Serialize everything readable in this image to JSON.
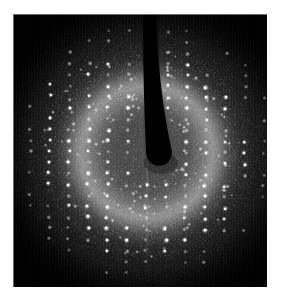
{
  "image": {
    "kind": "x-ray-fiber-diffraction-pattern",
    "caption": "",
    "canvas": {
      "width": 281,
      "height": 308,
      "background_color": "#ffffff"
    },
    "detector_panel": {
      "left": 13,
      "top": 14,
      "width": 254,
      "height": 273,
      "background_color": "#000000",
      "edge_highlight_color": "#bebebe"
    },
    "beam_center": {
      "x": 134,
      "y": 138
    },
    "colors": {
      "background": "#000000",
      "halo_peak": "#ffffff",
      "mid_glow": "#7d7d7d",
      "spot": "#ffffff",
      "beamstop_shadow": "#000000",
      "page": "#ffffff"
    },
    "beamstop": {
      "name": "beamstop-shadow",
      "top_y": 0,
      "tip_y": 138,
      "top_half_width": 7,
      "tip_half_width": 13,
      "tip_radius": 13,
      "lean_px": 12
    },
    "halo": {
      "peak_radius_px": 66,
      "inner_radius_px": 34,
      "outer_radius_px": 106,
      "secondary_radius_px": 118
    },
    "glow": {
      "radius_px": 150,
      "vignette_start_px": 104,
      "vignette_end_px": 168
    },
    "lattice": {
      "description": "vertical layer-line columns of sharp Bragg reflections",
      "column_spacing_px": 19.5,
      "row_spacing_px": 11.0,
      "column_count": 13,
      "row_count": 23,
      "tilt_deg": 0.6,
      "max_spot_radius_px": 2.3
    },
    "render": {
      "spot_count": 620,
      "speckle_count": 26000,
      "random_seed": 20240517
    }
  }
}
